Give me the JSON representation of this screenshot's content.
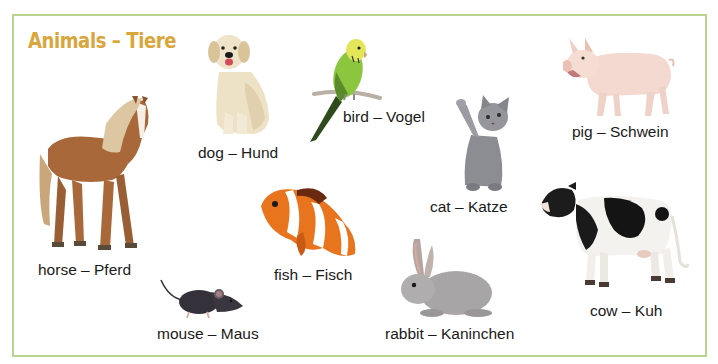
{
  "page": {
    "title": "Animals – Tiere",
    "colors": {
      "title": "#d9a63c",
      "frame_border": "#b9d48f",
      "label_text": "#1a1a1a",
      "background": "#ffffff"
    }
  },
  "animals": [
    {
      "id": "horse",
      "english": "horse",
      "german": "Pferd",
      "label": "horse – Pferd"
    },
    {
      "id": "dog",
      "english": "dog",
      "german": "Hund",
      "label": "dog – Hund"
    },
    {
      "id": "bird",
      "english": "bird",
      "german": "Vogel",
      "label": "bird – Vogel"
    },
    {
      "id": "cat",
      "english": "cat",
      "german": "Katze",
      "label": "cat – Katze"
    },
    {
      "id": "pig",
      "english": "pig",
      "german": "Schwein",
      "label": "pig – Schwein"
    },
    {
      "id": "fish",
      "english": "fish",
      "german": "Fisch",
      "label": "fish – Fisch"
    },
    {
      "id": "mouse",
      "english": "mouse",
      "german": "Maus",
      "label": "mouse – Maus"
    },
    {
      "id": "rabbit",
      "english": "rabbit",
      "german": "Kaninchen",
      "label": "rabbit – Kaninchen"
    },
    {
      "id": "cow",
      "english": "cow",
      "german": "Kuh",
      "label": "cow – Kuh"
    }
  ]
}
